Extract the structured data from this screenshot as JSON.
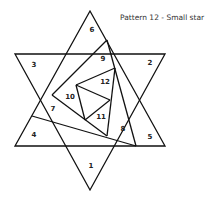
{
  "title": "Pattern 12 - Small star",
  "labels": {
    "p1": "1",
    "p2": "2",
    "p3": "3",
    "p4": "4",
    "p5": "5",
    "p6": "6",
    "p7": "7",
    "p8": "8",
    "p9": "9",
    "p10": "10",
    "p11": "11",
    "p12": "12"
  }
}
